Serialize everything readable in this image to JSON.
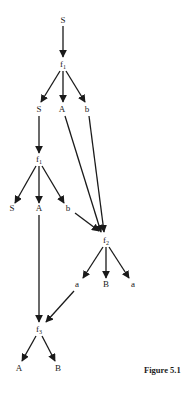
{
  "diagram": {
    "caption": "Figure 5.1",
    "nodes": [
      {
        "id": "n0",
        "label": "S",
        "sub": "",
        "x": 63,
        "y": 23
      },
      {
        "id": "n1",
        "label": "f",
        "sub": "1",
        "x": 63,
        "y": 67
      },
      {
        "id": "n2",
        "label": "S",
        "sub": "",
        "x": 39,
        "y": 112
      },
      {
        "id": "n3",
        "label": "A",
        "sub": "",
        "x": 62,
        "y": 112
      },
      {
        "id": "n4",
        "label": "b",
        "sub": "",
        "x": 87,
        "y": 112
      },
      {
        "id": "n5",
        "label": "f",
        "sub": "1",
        "x": 39,
        "y": 162
      },
      {
        "id": "n6",
        "label": "S",
        "sub": "",
        "x": 12,
        "y": 211
      },
      {
        "id": "n7",
        "label": "A",
        "sub": "",
        "x": 39,
        "y": 211
      },
      {
        "id": "n8",
        "label": "b",
        "sub": "",
        "x": 68,
        "y": 211
      },
      {
        "id": "n9",
        "label": "f",
        "sub": "2",
        "x": 106,
        "y": 243
      },
      {
        "id": "n10",
        "label": "a",
        "sub": "",
        "x": 77,
        "y": 287
      },
      {
        "id": "n11",
        "label": "B",
        "sub": "",
        "x": 106,
        "y": 287
      },
      {
        "id": "n12",
        "label": "a",
        "sub": "",
        "x": 133,
        "y": 287
      },
      {
        "id": "n13",
        "label": "f",
        "sub": "3",
        "x": 39,
        "y": 332
      },
      {
        "id": "n14",
        "label": "A",
        "sub": "",
        "x": 19,
        "y": 371
      },
      {
        "id": "n15",
        "label": "B",
        "sub": "",
        "x": 58,
        "y": 371
      }
    ],
    "edges": [
      {
        "from": "n0",
        "to": "n1",
        "x1": 63,
        "y1": 26,
        "x2": 63,
        "y2": 57
      },
      {
        "from": "n1",
        "to": "n2",
        "x1": 60,
        "y1": 71,
        "x2": 41,
        "y2": 102
      },
      {
        "from": "n1",
        "to": "n3",
        "x1": 63,
        "y1": 71,
        "x2": 63,
        "y2": 102
      },
      {
        "from": "n1",
        "to": "n4",
        "x1": 66,
        "y1": 71,
        "x2": 85,
        "y2": 102
      },
      {
        "from": "n2",
        "to": "n5",
        "x1": 39,
        "y1": 116,
        "x2": 39,
        "y2": 153
      },
      {
        "from": "n3",
        "to": "n9",
        "x1": 65,
        "y1": 116,
        "x2": 101,
        "y2": 232
      },
      {
        "from": "n4",
        "to": "n9",
        "x1": 89,
        "y1": 116,
        "x2": 104,
        "y2": 232
      },
      {
        "from": "n5",
        "to": "n6",
        "x1": 36,
        "y1": 166,
        "x2": 15,
        "y2": 203
      },
      {
        "from": "n5",
        "to": "n7",
        "x1": 39,
        "y1": 166,
        "x2": 39,
        "y2": 203
      },
      {
        "from": "n5",
        "to": "n8",
        "x1": 42,
        "y1": 166,
        "x2": 64,
        "y2": 203
      },
      {
        "from": "n8",
        "to": "n9",
        "x1": 75,
        "y1": 213,
        "x2": 99,
        "y2": 231
      },
      {
        "from": "n7",
        "to": "n13",
        "x1": 39,
        "y1": 215,
        "x2": 39,
        "y2": 322
      },
      {
        "from": "n9",
        "to": "n10",
        "x1": 103,
        "y1": 247,
        "x2": 83,
        "y2": 278
      },
      {
        "from": "n9",
        "to": "n11",
        "x1": 106,
        "y1": 247,
        "x2": 106,
        "y2": 278
      },
      {
        "from": "n9",
        "to": "n12",
        "x1": 109,
        "y1": 247,
        "x2": 129,
        "y2": 278
      },
      {
        "from": "n10",
        "to": "n13",
        "x1": 74,
        "y1": 291,
        "x2": 46,
        "y2": 322
      },
      {
        "from": "n13",
        "to": "n14",
        "x1": 36,
        "y1": 336,
        "x2": 22,
        "y2": 361
      },
      {
        "from": "n13",
        "to": "n15",
        "x1": 42,
        "y1": 336,
        "x2": 55,
        "y2": 361
      }
    ]
  }
}
